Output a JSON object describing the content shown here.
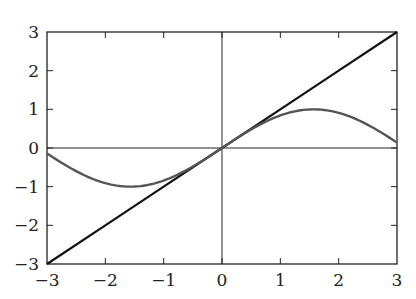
{
  "chart_data": {
    "type": "line",
    "title": "",
    "xlabel": "",
    "ylabel": "",
    "xlim": [
      -3,
      3
    ],
    "ylim": [
      -3,
      3
    ],
    "grid": false,
    "axes_through_origin": true,
    "x_ticks": [
      -3,
      -2,
      -1,
      0,
      1,
      2,
      3
    ],
    "y_ticks": [
      -3,
      -2,
      -1,
      0,
      1,
      2,
      3
    ],
    "x_tick_labels": [
      "−3",
      "−2",
      "−1",
      "0",
      "1",
      "2",
      "3"
    ],
    "y_tick_labels": [
      "−3",
      "−2",
      "−1",
      "0",
      "1",
      "2",
      "3"
    ],
    "series": [
      {
        "name": "y = x",
        "color": "#111111",
        "x": [
          -3,
          -2,
          -1,
          0,
          1,
          2,
          3
        ],
        "y": [
          -3,
          -2,
          -1,
          0,
          1,
          2,
          3
        ]
      },
      {
        "name": "y = sin(x)",
        "color": "#555555",
        "x": [
          -3,
          -2.5,
          -2,
          -1.5708,
          -1,
          -0.5,
          0,
          0.5,
          1,
          1.5708,
          2,
          2.5,
          3
        ],
        "y": [
          -0.141,
          -0.598,
          -0.909,
          -1.0,
          -0.841,
          -0.479,
          0,
          0.479,
          0.841,
          1.0,
          0.909,
          0.598,
          0.141
        ]
      }
    ],
    "legend": null
  }
}
